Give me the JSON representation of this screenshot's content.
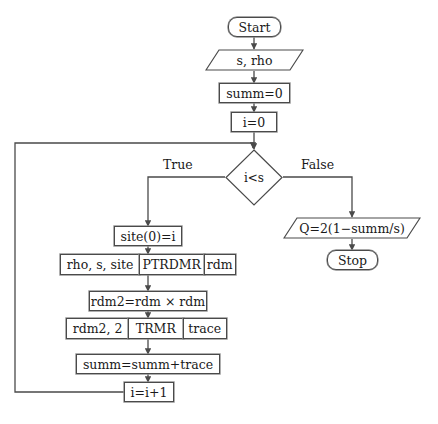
{
  "diagram": {
    "type": "flowchart",
    "nodes": {
      "start": {
        "label": "Start",
        "shape": "terminal"
      },
      "input": {
        "label": "s, rho",
        "shape": "io-parallelogram"
      },
      "init_summ": {
        "label": "summ=0",
        "shape": "process"
      },
      "init_i": {
        "label": "i=0",
        "shape": "process"
      },
      "decision": {
        "label": "i<s",
        "shape": "decision-diamond"
      },
      "site": {
        "label": "site(0)=i",
        "shape": "process"
      },
      "ptrdmr": {
        "shape": "subroutine",
        "inputs": "rho, s, site",
        "name": "PTRDMR",
        "outputs": "rdm"
      },
      "rdm2": {
        "label": "rdm2=rdm × rdm",
        "shape": "process"
      },
      "trmr": {
        "shape": "subroutine",
        "inputs": "rdm2, 2",
        "name": "TRMR",
        "outputs": "trace"
      },
      "accumulate": {
        "label": "summ=summ+trace",
        "shape": "process"
      },
      "increment": {
        "label": "i=i+1",
        "shape": "process"
      },
      "output": {
        "label": "Q=2(1−summ/s)",
        "shape": "io-parallelogram"
      },
      "stop": {
        "label": "Stop",
        "shape": "terminal"
      }
    },
    "edge_labels": {
      "true_branch": "True",
      "false_branch": "False"
    },
    "colors": {
      "stroke": "#4a4a4a",
      "stroke_outer": "#8d8d8d",
      "text": "#1a1a1a",
      "background": "#ffffff"
    }
  }
}
